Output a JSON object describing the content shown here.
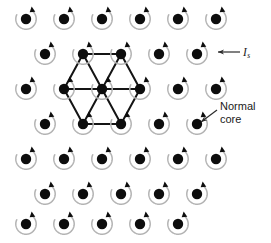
{
  "figure": {
    "background_color": "#ffffff",
    "width": 271,
    "height": 243
  },
  "colors": {
    "core_fill": "#0d0d0d",
    "current_arc": "#b3b3b3",
    "current_arc_dark": "#8a8a8a",
    "lattice_line": "#141414",
    "annotation_line": "#2b2b2b",
    "text": "#1a1a1a"
  },
  "vortex": {
    "core_radius": 5.2,
    "arc_radius": 10.2,
    "arrow_head_size": 4.2,
    "icon_name": "vortex-supercurrent-icon"
  },
  "lattice": {
    "type": "triangular",
    "row_spacing": 35.0,
    "column_spacing": 38.0,
    "row_offset": 19.0,
    "rows": [
      {
        "index": 0,
        "y": 19.0,
        "count": 6,
        "x_start": 26.0,
        "offset": false
      },
      {
        "index": 1,
        "y": 54.0,
        "count": 5,
        "x_start": 45.0,
        "offset": true
      },
      {
        "index": 2,
        "y": 89.0,
        "count": 6,
        "x_start": 26.0,
        "offset": false
      },
      {
        "index": 3,
        "y": 124.0,
        "count": 5,
        "x_start": 45.0,
        "offset": true
      },
      {
        "index": 4,
        "y": 159.0,
        "count": 6,
        "x_start": 26.0,
        "offset": false
      },
      {
        "index": 5,
        "y": 194.0,
        "count": 5,
        "x_start": 45.0,
        "offset": true
      },
      {
        "index": 6,
        "y": 224.0,
        "count": 5,
        "x_start": 26.0,
        "offset": false
      }
    ]
  },
  "unit_cell": {
    "name": "hexagonal-unit-cell",
    "center": {
      "x": 102.0,
      "y": 89.0
    },
    "vertices": [
      {
        "x": 83.0,
        "y": 54.0
      },
      {
        "x": 121.0,
        "y": 54.0
      },
      {
        "x": 140.0,
        "y": 89.0
      },
      {
        "x": 121.0,
        "y": 124.0
      },
      {
        "x": 83.0,
        "y": 124.0
      },
      {
        "x": 64.0,
        "y": 89.0
      }
    ],
    "edges": [
      [
        0,
        1
      ],
      [
        1,
        2
      ],
      [
        2,
        3
      ],
      [
        3,
        4
      ],
      [
        4,
        5
      ],
      [
        5,
        0
      ]
    ],
    "spokes": [
      [
        0,
        "center"
      ],
      [
        1,
        "center"
      ],
      [
        2,
        "center"
      ],
      [
        3,
        "center"
      ],
      [
        4,
        "center"
      ],
      [
        5,
        "center"
      ]
    ]
  },
  "annotations": [
    {
      "name": "supercurrent-label",
      "symbol": "I",
      "subscript": "s",
      "text_x": 243.0,
      "text_y": 55.5,
      "arrow": {
        "x1": 240.0,
        "y1": 52.0,
        "x2": 218.0,
        "y2": 52.0
      },
      "style": "italic-with-subscript"
    },
    {
      "name": "normal-core-label",
      "lines": [
        "Normal",
        "core"
      ],
      "text_x": 220.0,
      "text_y": 110.0,
      "line_height": 13.0,
      "arrow": {
        "x1": 217.0,
        "y1": 110.0,
        "x2": 201.0,
        "y2": 122.0
      },
      "style": "two-line-plain"
    }
  ]
}
